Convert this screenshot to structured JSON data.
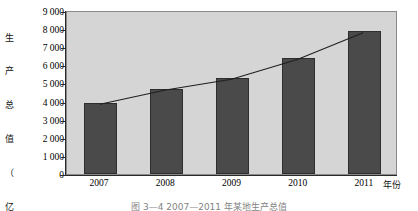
{
  "chart_data": {
    "type": "bar",
    "title": "",
    "categories": [
      "2007",
      "2008",
      "2009",
      "2010",
      "2011"
    ],
    "values": [
      3900,
      4700,
      5300,
      6400,
      7900
    ],
    "series": [
      {
        "name": "生产总值",
        "type": "bar",
        "values": [
          3900,
          4700,
          5300,
          6400,
          7900
        ]
      },
      {
        "name": "趋势线",
        "type": "line",
        "values": [
          3900,
          4700,
          5300,
          6400,
          7900
        ]
      }
    ],
    "xlabel": "年份",
    "ylabel": "生产总值（亿元）",
    "ylim": [
      0,
      9000
    ],
    "ytick_values": [
      0,
      1000,
      2000,
      3000,
      4000,
      5000,
      6000,
      7000,
      8000,
      9000
    ],
    "ytick_labels": [
      "0",
      "1 000",
      "2 000",
      "3 000",
      "4 000",
      "5 000",
      "6 000",
      "7 000",
      "8 000",
      "9 000"
    ],
    "grid": false,
    "legend": "none",
    "plot_background": "#d5d5d5",
    "bar_color": "#4a4a4a",
    "line_color": "#1f1f1f"
  },
  "axes": {
    "y_title_chars": [
      "生",
      "产",
      "总",
      "值",
      "（",
      "亿",
      "元",
      "）"
    ],
    "x_title": "年份"
  },
  "caption": {
    "text": "图 3—4  2007—2011 年某地生产总值"
  }
}
